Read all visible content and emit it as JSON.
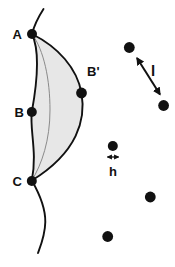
{
  "diagram": {
    "title_hint": "curve-with-chords-and-dots-figure",
    "labels": {
      "point_a": "A",
      "point_b": "B",
      "point_b_prime": "B'",
      "point_c": "C",
      "length": "l",
      "spacing": "h"
    },
    "colors": {
      "background": "#ffffff",
      "stroke": "#111111",
      "region_fill": "#e7e7e7",
      "midline": "#8a8a8a"
    }
  }
}
